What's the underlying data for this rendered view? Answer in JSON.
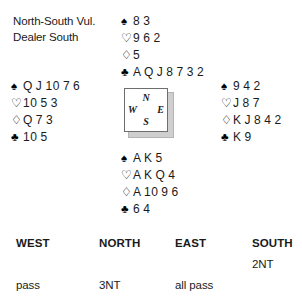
{
  "header": {
    "vulnerability": "North-South Vul.",
    "dealer": "Dealer South"
  },
  "compass": {
    "north": "N",
    "west": "W",
    "east": "E",
    "south": "S"
  },
  "suits": {
    "spade": "♠",
    "heart": "♡",
    "diamond": "♢",
    "club": "♣"
  },
  "hands": {
    "north": {
      "label": "North",
      "spades": "8 3",
      "hearts": "9 6 2",
      "diamonds": "5",
      "clubs": "A Q J 8 7 3 2"
    },
    "west": {
      "label": "West",
      "spades": "Q J 10 7 6",
      "hearts": "10 5 3",
      "diamonds": "Q 7 3",
      "clubs": "10 5"
    },
    "east": {
      "label": "East",
      "spades": "9 4 2",
      "hearts": "J 8 7",
      "diamonds": "K J 8 4 2",
      "clubs": "K 9"
    },
    "south": {
      "label": "South",
      "spades": "A K 5",
      "hearts": "A K Q 4",
      "diamonds": "A 10 9 6",
      "clubs": "6 4"
    }
  },
  "auction": {
    "headers": {
      "west": "WEST",
      "north": "NORTH",
      "east": "EAST",
      "south": "SOUTH"
    },
    "rows": [
      {
        "west": "",
        "north": "",
        "east": "",
        "south": "2NT"
      },
      {
        "west": "pass",
        "north": "3NT",
        "east": "all pass",
        "south": ""
      }
    ]
  }
}
